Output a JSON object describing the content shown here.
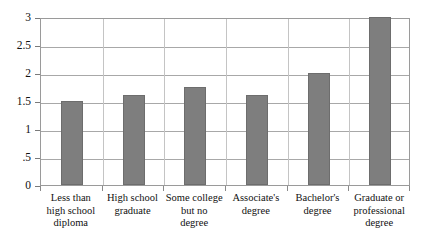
{
  "chart_data": {
    "type": "bar",
    "title": "",
    "subtitle": "",
    "xlabel": "",
    "ylabel": "",
    "categories": [
      "Less than high school diploma",
      "High school graduate",
      "Some college but no degree",
      "Associate's degree",
      "Bachelor's degree",
      "Graduate or professional degree"
    ],
    "category_lines": [
      [
        "Less than",
        "high school",
        "diploma"
      ],
      [
        "High school",
        "graduate"
      ],
      [
        "Some college",
        "but no",
        "degree"
      ],
      [
        "Associate's",
        "degree"
      ],
      [
        "Bachelor's",
        "degree"
      ],
      [
        "Graduate or",
        "professional",
        "degree"
      ]
    ],
    "values": [
      1.5,
      1.6,
      1.75,
      1.6,
      2,
      3
    ],
    "ylim": [
      0,
      3
    ],
    "ytick_values": [
      0,
      0.5,
      1,
      1.5,
      2,
      2.5,
      3
    ],
    "ytick_labels": [
      "0",
      ".5",
      "1",
      "1.5",
      "2",
      "2.5",
      "3"
    ],
    "grid": true,
    "legend": false,
    "legend_position": "none",
    "bar_color": "#7e7e7e",
    "bar_border_color": "#6d6d6d",
    "gridline_color": "#a8a8a8",
    "frame_color": "#9a9a9a",
    "background_color": "#ffffff",
    "text_color": "#111111"
  }
}
